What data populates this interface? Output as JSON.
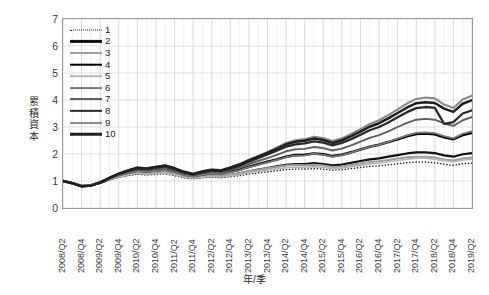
{
  "chart_data": {
    "type": "line",
    "title": "",
    "xlabel": "年/季",
    "ylabel": "累積資本",
    "ylim": [
      0,
      7
    ],
    "ystep": 1,
    "grid": true,
    "legend_position": "top-left-inside",
    "ytick_labels": [
      "7",
      "6",
      "5",
      "4",
      "3",
      "2",
      "1",
      "0"
    ],
    "x": [
      "2008/Q2",
      "2008/Q3",
      "2008/Q4",
      "2009/Q1",
      "2009/Q2",
      "2009/Q3",
      "2009/Q4",
      "2010/Q1",
      "2010/Q2",
      "2010/Q3",
      "2010/Q4",
      "2011/Q1",
      "2011/Q2",
      "2011/Q3",
      "2011/Q4",
      "2012/Q1",
      "2012/Q2",
      "2012/Q3",
      "2012/Q4",
      "2013/Q1",
      "2013/Q2",
      "2013/Q3",
      "2013/Q4",
      "2014/Q1",
      "2014/Q2",
      "2014/Q3",
      "2014/Q4",
      "2015/Q1",
      "2015/Q2",
      "2015/Q3",
      "2015/Q4",
      "2016/Q1",
      "2016/Q2",
      "2016/Q3",
      "2016/Q4",
      "2017/Q1",
      "2017/Q2",
      "2017/Q3",
      "2017/Q4",
      "2018/Q1",
      "2018/Q2",
      "2018/Q3",
      "2018/Q4",
      "2019/Q1",
      "2019/Q2"
    ],
    "xtick_labels": [
      "2008/Q2",
      "2008/Q4",
      "2009/Q2",
      "2009/Q4",
      "2010/Q2",
      "2010/Q4",
      "2011/Q2",
      "2011/Q4",
      "2012/Q2",
      "2012/Q4",
      "2013/Q2",
      "2013/Q4",
      "2014/Q2",
      "2014/Q4",
      "2015/Q2",
      "2015/Q4",
      "2016/Q2",
      "2016/Q4",
      "2017/Q2",
      "2017/Q4",
      "2018/Q2",
      "2018/Q4",
      "2019/Q2"
    ],
    "xtick_every": 2,
    "series": [
      {
        "name": "1",
        "style": "dotted",
        "color": "#1a1a1a",
        "width": 1.5,
        "values": [
          1.0,
          0.93,
          0.84,
          0.86,
          0.94,
          1.05,
          1.14,
          1.2,
          1.25,
          1.22,
          1.24,
          1.26,
          1.2,
          1.12,
          1.08,
          1.12,
          1.14,
          1.12,
          1.16,
          1.2,
          1.26,
          1.3,
          1.34,
          1.38,
          1.42,
          1.44,
          1.44,
          1.46,
          1.44,
          1.4,
          1.42,
          1.46,
          1.5,
          1.54,
          1.56,
          1.6,
          1.64,
          1.68,
          1.7,
          1.7,
          1.68,
          1.62,
          1.58,
          1.64,
          1.66
        ]
      },
      {
        "name": "2",
        "style": "solid",
        "color": "#111111",
        "width": 2.2,
        "values": [
          1.0,
          0.92,
          0.82,
          0.84,
          0.93,
          1.06,
          1.16,
          1.24,
          1.3,
          1.27,
          1.3,
          1.32,
          1.25,
          1.16,
          1.11,
          1.16,
          1.19,
          1.17,
          1.22,
          1.28,
          1.36,
          1.42,
          1.48,
          1.54,
          1.6,
          1.63,
          1.63,
          1.66,
          1.63,
          1.58,
          1.61,
          1.67,
          1.74,
          1.8,
          1.84,
          1.9,
          1.96,
          2.02,
          2.06,
          2.06,
          2.03,
          1.95,
          1.9,
          1.99,
          2.03
        ]
      },
      {
        "name": "3",
        "style": "solid",
        "color": "#9e9e9e",
        "width": 2.0,
        "values": [
          1.0,
          0.93,
          0.83,
          0.85,
          0.94,
          1.07,
          1.17,
          1.25,
          1.31,
          1.28,
          1.31,
          1.33,
          1.26,
          1.17,
          1.12,
          1.17,
          1.2,
          1.18,
          1.23,
          1.29,
          1.36,
          1.42,
          1.47,
          1.52,
          1.57,
          1.59,
          1.58,
          1.6,
          1.57,
          1.52,
          1.54,
          1.59,
          1.65,
          1.7,
          1.73,
          1.78,
          1.83,
          1.88,
          1.9,
          1.9,
          1.87,
          1.8,
          1.76,
          1.83,
          1.86
        ]
      },
      {
        "name": "4",
        "style": "solid",
        "color": "#000000",
        "width": 2.6,
        "values": [
          1.0,
          0.92,
          0.81,
          0.84,
          0.94,
          1.09,
          1.21,
          1.31,
          1.39,
          1.36,
          1.4,
          1.43,
          1.35,
          1.24,
          1.18,
          1.25,
          1.29,
          1.27,
          1.34,
          1.42,
          1.53,
          1.62,
          1.71,
          1.8,
          1.9,
          1.96,
          1.97,
          2.02,
          1.99,
          1.92,
          1.97,
          2.06,
          2.17,
          2.27,
          2.34,
          2.44,
          2.55,
          2.66,
          2.74,
          2.76,
          2.73,
          2.62,
          2.55,
          2.7,
          2.78
        ]
      },
      {
        "name": "5",
        "style": "solid",
        "color": "#b5b5b5",
        "width": 1.6,
        "values": [
          1.0,
          0.93,
          0.84,
          0.86,
          0.95,
          1.06,
          1.15,
          1.22,
          1.28,
          1.25,
          1.27,
          1.29,
          1.23,
          1.15,
          1.1,
          1.14,
          1.17,
          1.15,
          1.19,
          1.24,
          1.31,
          1.36,
          1.4,
          1.45,
          1.49,
          1.51,
          1.51,
          1.53,
          1.5,
          1.46,
          1.48,
          1.53,
          1.58,
          1.63,
          1.66,
          1.71,
          1.76,
          1.81,
          1.84,
          1.84,
          1.81,
          1.75,
          1.71,
          1.78,
          1.81
        ]
      },
      {
        "name": "6",
        "style": "solid",
        "color": "#777777",
        "width": 1.8,
        "values": [
          1.0,
          0.92,
          0.82,
          0.84,
          0.94,
          1.08,
          1.2,
          1.29,
          1.37,
          1.34,
          1.38,
          1.41,
          1.33,
          1.22,
          1.16,
          1.23,
          1.27,
          1.25,
          1.32,
          1.4,
          1.51,
          1.6,
          1.69,
          1.78,
          1.88,
          1.94,
          1.95,
          2.01,
          1.97,
          1.9,
          1.96,
          2.05,
          2.16,
          2.27,
          2.34,
          2.45,
          2.57,
          2.69,
          2.78,
          2.8,
          2.77,
          2.66,
          2.58,
          2.75,
          2.84
        ]
      },
      {
        "name": "7",
        "style": "solid",
        "color": "#5e5e5e",
        "width": 1.9,
        "values": [
          1.0,
          0.92,
          0.81,
          0.83,
          0.94,
          1.1,
          1.23,
          1.34,
          1.43,
          1.4,
          1.45,
          1.49,
          1.4,
          1.28,
          1.21,
          1.29,
          1.34,
          1.32,
          1.4,
          1.5,
          1.63,
          1.74,
          1.85,
          1.97,
          2.1,
          2.17,
          2.19,
          2.26,
          2.22,
          2.13,
          2.2,
          2.32,
          2.46,
          2.6,
          2.7,
          2.84,
          3.0,
          3.15,
          3.27,
          3.3,
          3.27,
          3.13,
          3.04,
          3.25,
          3.37
        ]
      },
      {
        "name": "8",
        "style": "solid",
        "color": "#2a2a2a",
        "width": 2.3,
        "values": [
          1.0,
          0.92,
          0.81,
          0.83,
          0.95,
          1.11,
          1.25,
          1.37,
          1.47,
          1.44,
          1.5,
          1.54,
          1.45,
          1.32,
          1.24,
          1.33,
          1.39,
          1.37,
          1.46,
          1.57,
          1.72,
          1.85,
          1.98,
          2.12,
          2.27,
          2.36,
          2.39,
          2.47,
          2.42,
          2.32,
          2.41,
          2.55,
          2.71,
          2.88,
          3.0,
          3.17,
          3.36,
          3.55,
          3.7,
          3.74,
          3.71,
          3.12,
          3.18,
          3.5,
          3.62
        ]
      },
      {
        "name": "9",
        "style": "solid",
        "color": "#8a8a8a",
        "width": 2.1,
        "values": [
          1.0,
          0.92,
          0.81,
          0.84,
          0.96,
          1.12,
          1.27,
          1.4,
          1.5,
          1.47,
          1.53,
          1.58,
          1.48,
          1.35,
          1.27,
          1.37,
          1.43,
          1.41,
          1.51,
          1.63,
          1.79,
          1.93,
          2.08,
          2.24,
          2.41,
          2.51,
          2.55,
          2.64,
          2.59,
          2.48,
          2.58,
          2.74,
          2.92,
          3.11,
          3.25,
          3.44,
          3.65,
          3.87,
          4.04,
          4.09,
          4.06,
          3.83,
          3.7,
          4.02,
          4.16
        ]
      },
      {
        "name": "10",
        "style": "solid",
        "color": "#1f1f1f",
        "width": 2.5,
        "values": [
          1.0,
          0.92,
          0.8,
          0.83,
          0.95,
          1.12,
          1.27,
          1.39,
          1.49,
          1.46,
          1.52,
          1.57,
          1.47,
          1.34,
          1.26,
          1.35,
          1.41,
          1.39,
          1.49,
          1.61,
          1.76,
          1.9,
          2.04,
          2.19,
          2.36,
          2.45,
          2.49,
          2.57,
          2.52,
          2.41,
          2.51,
          2.66,
          2.83,
          3.01,
          3.14,
          3.32,
          3.52,
          3.72,
          3.88,
          3.92,
          3.89,
          3.68,
          3.56,
          3.86,
          3.99
        ]
      }
    ]
  }
}
